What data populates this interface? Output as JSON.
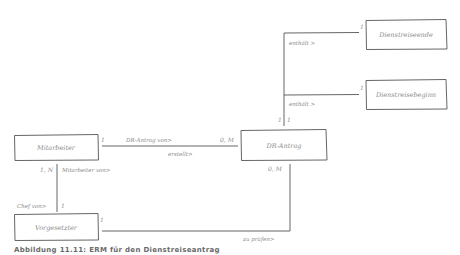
{
  "entities": {
    "mitarbeiter": "Mitarbeiter",
    "dr_antrag": "DR-Antrag",
    "vorgesetzter": "Vorgesetzter",
    "dienstreiseende": "Dienstreiseende",
    "dienstreisebeginn": "Dienstreisebeginn"
  },
  "relationships": {
    "dr_antrag_von": "DR-Antrag von>",
    "erstellt": "erstellt>",
    "mitarbeiter_von": "Mitarbeiter von>",
    "chef_von": "Chef von>",
    "zu_pruefen": "zu prüfen>",
    "enthaelt_ende": "enthält >",
    "enthaelt_beginn": "enthält >"
  },
  "cardinalities": {
    "mitarbeiter_antrag": "1",
    "antrag_mitarbeiter": "0, M",
    "mitarbeiter_vorgesetzter": "1, N",
    "vorgesetzter_mitarbeiter": "1",
    "vorgesetzter_antrag": "1",
    "antrag_vorgesetzter": "0, M",
    "antrag_ende": "1",
    "antrag_beginn": "1",
    "ende": "1",
    "beginn": "1"
  },
  "caption": "Abbildung 11.11: ERM für den Dienstreiseantrag"
}
